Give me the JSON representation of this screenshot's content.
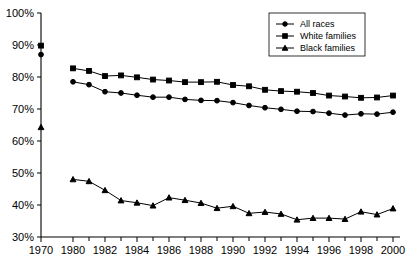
{
  "chart_data": {
    "type": "line",
    "title": "",
    "subtitle": "",
    "xlabel": "",
    "ylabel": "",
    "xlim": [
      1969,
      2001
    ],
    "ylim": [
      30,
      100
    ],
    "grid": false,
    "legend_position": "top-right",
    "y_tick_labels": [
      "100%",
      "90%",
      "80%",
      "70%",
      "60%",
      "50%",
      "40%",
      "30%"
    ],
    "y_ticks": [
      100,
      90,
      80,
      70,
      60,
      50,
      40,
      30
    ],
    "x_tick_labels": [
      "1970",
      "1980",
      "1982",
      "1984",
      "1986",
      "1988",
      "1990",
      "1992",
      "1994",
      "1996",
      "1998",
      "2000"
    ],
    "x_ticks": [
      1970,
      1980,
      1982,
      1984,
      1986,
      1988,
      1990,
      1992,
      1994,
      1996,
      1998,
      2000
    ],
    "x_minor_ticks": [
      1981,
      1983,
      1985,
      1987,
      1989,
      1991,
      1993,
      1995,
      1997,
      1999
    ],
    "x": [
      1980,
      1981,
      1982,
      1983,
      1984,
      1985,
      1986,
      1987,
      1988,
      1989,
      1990,
      1991,
      1992,
      1993,
      1994,
      1995,
      1996,
      1997,
      1998,
      1999,
      2000
    ],
    "series": [
      {
        "name": "All races",
        "marker": "circle",
        "color": "#000000",
        "isolated_points": [
          {
            "x": 1970,
            "y": 87.0
          }
        ],
        "values": [
          78.5,
          77.6,
          75.4,
          75.0,
          74.3,
          73.7,
          73.7,
          73.0,
          72.7,
          72.6,
          72.0,
          71.1,
          70.4,
          69.9,
          69.3,
          69.2,
          68.7,
          68.1,
          68.5,
          68.4,
          69.0
        ]
      },
      {
        "name": "White families",
        "marker": "square",
        "color": "#000000",
        "isolated_points": [
          {
            "x": 1970,
            "y": 89.8
          }
        ],
        "values": [
          82.7,
          81.9,
          80.3,
          80.5,
          79.9,
          79.2,
          78.9,
          78.4,
          78.4,
          78.5,
          77.5,
          77.1,
          76.0,
          75.6,
          75.4,
          75.0,
          74.2,
          73.9,
          73.5,
          73.6,
          74.2
        ]
      },
      {
        "name": "Black families",
        "marker": "triangle",
        "color": "#000000",
        "isolated_points": [
          {
            "x": 1970,
            "y": 64.3
          }
        ],
        "values": [
          48.0,
          47.4,
          44.6,
          41.4,
          40.7,
          39.8,
          42.3,
          41.5,
          40.6,
          39.0,
          39.6,
          37.4,
          37.8,
          37.2,
          35.4,
          35.9,
          35.9,
          35.6,
          37.9,
          37.0,
          38.9
        ]
      }
    ]
  },
  "legend": {
    "items": [
      {
        "label": "All races"
      },
      {
        "label": "White families"
      },
      {
        "label": "Black families"
      }
    ]
  }
}
